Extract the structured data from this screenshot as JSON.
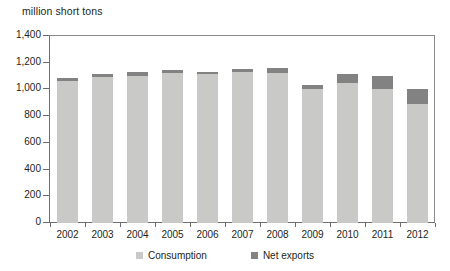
{
  "chart_data": {
    "type": "bar",
    "title": "million short tons",
    "subtitle": "",
    "xlabel": "",
    "ylabel": "million short tons",
    "stacked": true,
    "grid": false,
    "legend_position": "bottom",
    "ylim": [
      0,
      1400
    ],
    "ytick_step": 200,
    "ytick_labels": [
      "0",
      "200",
      "400",
      "600",
      "800",
      "1,000",
      "1,200",
      "1,400"
    ],
    "ytick_values": [
      0,
      200,
      400,
      600,
      800,
      1000,
      1200,
      1400
    ],
    "categories": [
      "2002",
      "2003",
      "2004",
      "2005",
      "2006",
      "2007",
      "2008",
      "2009",
      "2010",
      "2011",
      "2012"
    ],
    "series": [
      {
        "name": "Consumption",
        "color": "#c9c9c7",
        "values": [
          1066,
          1095,
          1104,
          1125,
          1112,
          1128,
          1121,
          1000,
          1048,
          1003,
          890
        ]
      },
      {
        "name": "Net exports",
        "color": "#828282",
        "values": [
          20,
          20,
          29,
          18,
          15,
          25,
          39,
          30,
          66,
          98,
          110
        ]
      }
    ],
    "totals": [
      1086,
      1115,
      1133,
      1143,
      1127,
      1153,
      1160,
      1030,
      1114,
      1101,
      1000
    ]
  },
  "legend": {
    "items": [
      {
        "label": "Consumption",
        "color": "#c9c9c7",
        "swatch_name": "legend-swatch-consumption"
      },
      {
        "label": "Net exports",
        "color": "#828282",
        "swatch_name": "legend-swatch-net-exports"
      }
    ]
  }
}
